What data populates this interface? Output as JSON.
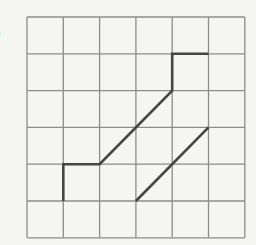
{
  "figure": {
    "label": ")",
    "colors": {
      "background": "#f5f5f3",
      "grid": "#8c8c8c",
      "path": "#464646"
    },
    "grid": {
      "columns": 6,
      "rows": 6,
      "origin_px": [
        27,
        17
      ],
      "cell_w_px": 36.3,
      "cell_h_px": 36.8
    },
    "paths": [
      {
        "name": "stepped-path",
        "points_grid": [
          [
            1,
            5
          ],
          [
            1,
            4
          ],
          [
            2,
            4
          ],
          [
            4,
            2
          ],
          [
            4,
            1
          ],
          [
            5,
            1
          ]
        ]
      },
      {
        "name": "diagonal-segment",
        "points_grid": [
          [
            3,
            5
          ],
          [
            5,
            3
          ]
        ]
      }
    ]
  }
}
